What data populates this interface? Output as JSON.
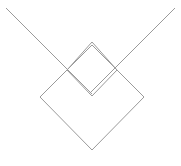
{
  "canvas": {
    "width": 181,
    "height": 166,
    "background_color": "#ffffff",
    "title": "Geometric line figure: two overlapping diamonds with extended diagonals"
  },
  "style": {
    "stroke_color": "#9a9a9a",
    "stroke_width": 1,
    "fill": "none"
  },
  "shapes": {
    "large_diamond": {
      "name": "large-diamond",
      "description": "Large rotated square (diamond) outline",
      "points": "40,97 92,45 144,97 92,150",
      "vertices": {
        "left": [
          40,
          97
        ],
        "top": [
          92,
          45
        ],
        "right": [
          144,
          97
        ],
        "bottom": [
          92,
          150
        ]
      }
    },
    "small_diamond": {
      "name": "small-diamond",
      "description": "Small rotated square (diamond) outline overlapping the upper half of the large diamond",
      "points": "67,70 92,42 117,70 92,96",
      "vertices": {
        "left": [
          67,
          70
        ],
        "top": [
          92,
          42
        ],
        "right": [
          117,
          70
        ],
        "bottom": [
          92,
          96
        ]
      }
    },
    "diagonal_left": {
      "name": "diagonal-line-top-left",
      "description": "Long straight diagonal from upper-left corner descending to the right",
      "x1": 6,
      "y1": 8,
      "x2": 92,
      "y2": 94
    },
    "diagonal_right": {
      "name": "diagonal-line-top-right",
      "description": "Long straight diagonal from upper-right corner descending to the left",
      "x1": 175,
      "y1": 8,
      "x2": 89,
      "y2": 94
    }
  },
  "chart_data": {
    "type": "scatter",
    "xlabel": "",
    "ylabel": "",
    "xlim": [
      0,
      181
    ],
    "ylim": [
      0,
      166
    ],
    "grid": false,
    "legend": "none",
    "annotations": [],
    "series": [
      {
        "name": "large-diamond",
        "kind": "closed-polygon",
        "x": [
          40,
          92,
          144,
          92,
          40
        ],
        "y": [
          97,
          45,
          97,
          150,
          97
        ]
      },
      {
        "name": "small-diamond",
        "kind": "closed-polygon",
        "x": [
          67,
          92,
          117,
          92,
          67
        ],
        "y": [
          70,
          42,
          70,
          96,
          70
        ]
      },
      {
        "name": "diagonal-line-top-left",
        "kind": "open-segment",
        "x": [
          6,
          92
        ],
        "y": [
          8,
          94
        ]
      },
      {
        "name": "diagonal-line-top-right",
        "kind": "open-segment",
        "x": [
          175,
          89
        ],
        "y": [
          8,
          94
        ]
      }
    ]
  }
}
